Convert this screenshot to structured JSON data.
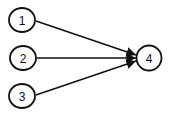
{
  "diagram": {
    "type": "directed-graph",
    "nodes": [
      {
        "id": "1",
        "label": "1",
        "cx": 22,
        "cy": 20
      },
      {
        "id": "2",
        "label": "2",
        "cx": 23,
        "cy": 58
      },
      {
        "id": "3",
        "label": "3",
        "cx": 22,
        "cy": 96
      },
      {
        "id": "4",
        "label": "4",
        "cx": 149,
        "cy": 58
      }
    ],
    "edges": [
      {
        "from": "1",
        "to": "4"
      },
      {
        "from": "2",
        "to": "4"
      },
      {
        "from": "3",
        "to": "4"
      }
    ],
    "colors": {
      "stroke": "#111111",
      "fill": "#ffffff"
    }
  }
}
